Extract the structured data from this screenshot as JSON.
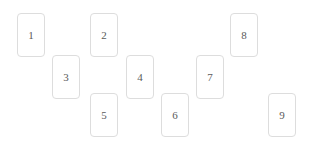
{
  "canvas": {
    "name": "card-layout-canvas",
    "width": 312,
    "height": 146,
    "background_color": "#ffffff"
  },
  "card_style": {
    "width": 28,
    "height": 44,
    "border_color": "#dddddd",
    "border_radius": 4,
    "fill_color": "#ffffff",
    "text_color": "#5a5a5a",
    "font_size": 11
  },
  "cards": [
    {
      "label": "1",
      "x": 17,
      "y": 13
    },
    {
      "label": "2",
      "x": 90,
      "y": 13
    },
    {
      "label": "3",
      "x": 52,
      "y": 55
    },
    {
      "label": "4",
      "x": 126,
      "y": 55
    },
    {
      "label": "5",
      "x": 90,
      "y": 93
    },
    {
      "label": "6",
      "x": 161,
      "y": 93
    },
    {
      "label": "7",
      "x": 196,
      "y": 55
    },
    {
      "label": "8",
      "x": 230,
      "y": 13
    },
    {
      "label": "9",
      "x": 268,
      "y": 93
    }
  ]
}
